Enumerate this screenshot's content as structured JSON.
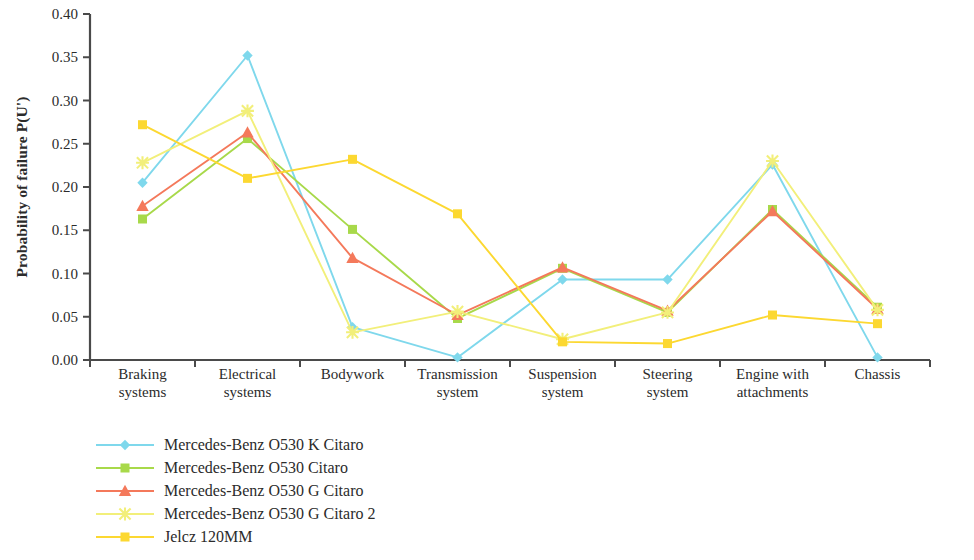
{
  "chart_data": {
    "type": "line",
    "title": "",
    "xlabel": "",
    "ylabel": "Probability of failure P(U')",
    "ylim": [
      0.0,
      0.4
    ],
    "yticks": [
      "0.00",
      "0.05",
      "0.10",
      "0.15",
      "0.20",
      "0.25",
      "0.30",
      "0.35",
      "0.40"
    ],
    "ytick_values": [
      0.0,
      0.05,
      0.1,
      0.15,
      0.2,
      0.25,
      0.3,
      0.35,
      0.4
    ],
    "grid": false,
    "legend_position": "bottom-left",
    "categories": [
      "Braking systems",
      "Electrical systems",
      "Bodywork",
      "Transmission system",
      "Suspension system",
      "Steering system",
      "Engine with attachments",
      "Chassis"
    ],
    "category_lines": [
      [
        "Braking",
        "systems"
      ],
      [
        "Electrical",
        "systems"
      ],
      [
        "Bodywork"
      ],
      [
        "Transmission",
        "system"
      ],
      [
        "Suspension",
        "system"
      ],
      [
        "Steering",
        "system"
      ],
      [
        "Engine with",
        "attachments"
      ],
      [
        "Chassis"
      ]
    ],
    "series": [
      {
        "name": "Mercedes-Benz O530 K Citaro",
        "color": "#7FD8EC",
        "marker": "diamond",
        "values": [
          0.205,
          0.352,
          0.038,
          0.003,
          0.093,
          0.093,
          0.226,
          0.003
        ]
      },
      {
        "name": "Mercedes-Benz O530 Citaro",
        "color": "#A8D94A",
        "marker": "square",
        "values": [
          0.163,
          0.256,
          0.151,
          0.048,
          0.106,
          0.055,
          0.174,
          0.061
        ]
      },
      {
        "name": "Mercedes-Benz O530 G Citaro",
        "color": "#F4795B",
        "marker": "triangle",
        "values": [
          0.178,
          0.263,
          0.118,
          0.052,
          0.107,
          0.057,
          0.172,
          0.059
        ]
      },
      {
        "name": "Mercedes-Benz O530 G Citaro 2",
        "color": "#F2EF7A",
        "marker": "cross",
        "values": [
          0.228,
          0.288,
          0.032,
          0.056,
          0.024,
          0.055,
          0.23,
          0.058
        ]
      },
      {
        "name": "Jelcz 120MM",
        "color": "#FCD831",
        "marker": "square",
        "values": [
          0.272,
          0.21,
          0.232,
          0.169,
          0.021,
          0.019,
          0.052,
          0.042
        ]
      }
    ],
    "axis_color": "#4a4a4a"
  }
}
